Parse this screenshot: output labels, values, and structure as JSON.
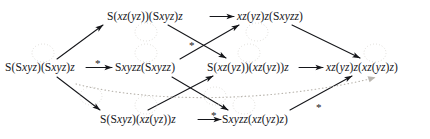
{
  "figure": {
    "kind": "reduction-diagram",
    "width": 430,
    "height": 139,
    "ink_color": "#15161a",
    "artifact_color": "#c9c6c0"
  },
  "nodes": [
    {
      "id": "n-top-left",
      "name": "term-S-xz-yz-Sxyz-z",
      "text": "S(xz(yz))(Sxyz)z",
      "x": 107,
      "y": 11,
      "row": "top"
    },
    {
      "id": "n-top-right",
      "name": "term-xz-yz-z-Sxyzz",
      "text": "xz(yz)z(Sxyzz)",
      "x": 237,
      "y": 11,
      "row": "top"
    },
    {
      "id": "n-mid-1",
      "name": "term-S-Sxyz-Sxyz-z",
      "text": "S(Sxyz)(Sxyz)z",
      "x": 5,
      "y": 62,
      "row": "middle"
    },
    {
      "id": "n-mid-2",
      "name": "term-Sxyzz-Sxyzz",
      "text": "Sxyzz(Sxyzz)",
      "x": 115,
      "y": 62,
      "row": "middle"
    },
    {
      "id": "n-mid-3",
      "name": "term-S-xz-yz-xz-yz-z",
      "text": "S(xz(yz))(xz(yz))z",
      "x": 207,
      "y": 62,
      "row": "middle"
    },
    {
      "id": "n-mid-4",
      "name": "term-xz-yz-z-xz-yz-z",
      "text": "xz(yz)z(xz(yz)z)",
      "x": 326,
      "y": 62,
      "row": "middle"
    },
    {
      "id": "n-bot-left",
      "name": "term-S-Sxyz-xz-yz-z",
      "text": "S(Sxyz)(xz(yz))z",
      "x": 100,
      "y": 114,
      "row": "bottom"
    },
    {
      "id": "n-bot-right",
      "name": "term-Sxyzz-xz-yz-z",
      "text": "Sxyzz(xz(yz)z)",
      "x": 222,
      "y": 114,
      "row": "bottom"
    }
  ],
  "star_labels": [
    {
      "id": "star-mid-h",
      "name": "star-label-left-horizontal",
      "text": "*",
      "x": 95,
      "y": 58
    },
    {
      "id": "star-cross-top",
      "name": "star-label-upper-crossing",
      "text": "*",
      "x": 189,
      "y": 40
    },
    {
      "id": "star-bot-h",
      "name": "star-label-bottom-horizontal",
      "text": "*",
      "x": 211,
      "y": 110
    },
    {
      "id": "star-dotted",
      "name": "star-label-dotted-curve",
      "text": "*",
      "x": 316,
      "y": 102
    }
  ],
  "edges": [
    {
      "id": "e1",
      "name": "edge-mid1-to-mid2",
      "style": "solid",
      "starred": true
    },
    {
      "id": "e2",
      "name": "edge-mid1-to-topleft",
      "style": "solid",
      "starred": false
    },
    {
      "id": "e3",
      "name": "edge-mid1-to-botleft",
      "style": "solid",
      "starred": false
    },
    {
      "id": "e4",
      "name": "edge-topleft-to-topright",
      "style": "solid",
      "starred": false
    },
    {
      "id": "e5",
      "name": "edge-topleft-to-mid3",
      "style": "solid",
      "starred": false
    },
    {
      "id": "e6",
      "name": "edge-mid2-to-topright",
      "style": "solid",
      "starred": true
    },
    {
      "id": "e7",
      "name": "edge-mid2-to-botright",
      "style": "solid",
      "starred": false
    },
    {
      "id": "e8",
      "name": "edge-botleft-to-botright",
      "style": "solid",
      "starred": true
    },
    {
      "id": "e9",
      "name": "edge-botleft-to-mid3",
      "style": "solid",
      "starred": false
    },
    {
      "id": "e10",
      "name": "edge-topright-to-mid4",
      "style": "solid",
      "starred": false
    },
    {
      "id": "e11",
      "name": "edge-mid3-to-mid4",
      "style": "solid",
      "starred": false
    },
    {
      "id": "e12",
      "name": "edge-botright-to-mid4",
      "style": "solid",
      "starred": false
    },
    {
      "id": "e13",
      "name": "edge-dotted-mid1-to-mid4",
      "style": "dotted",
      "starred": true
    }
  ]
}
